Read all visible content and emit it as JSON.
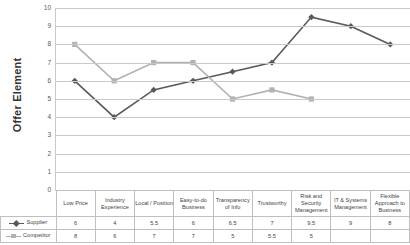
{
  "chart_data": {
    "type": "line",
    "title": "",
    "xlabel": "",
    "ylabel": "Offer Element",
    "ylim": [
      0,
      10
    ],
    "ytick_step": 1,
    "yticks": [
      0,
      1,
      2,
      3,
      4,
      5,
      6,
      7,
      8,
      9,
      10
    ],
    "grid": true,
    "legend_position": "data-table-left",
    "categories": [
      "Low Price",
      "Industry Experience",
      "Local / Position",
      "Easy-to-do Business",
      "Transparency of Info",
      "Trustworthy",
      "Risk and Security Management",
      "IT & Systems Management",
      "Flexible Approach to Business"
    ],
    "series": [
      {
        "name": "Supplier",
        "color": "#595959",
        "marker": "diamond",
        "values": [
          6,
          4,
          5.5,
          6,
          6.5,
          7,
          9.5,
          9,
          8
        ],
        "labels": [
          "6",
          "4",
          "5.5",
          "6",
          "6.5",
          "7",
          "9.5",
          "9",
          "8"
        ]
      },
      {
        "name": "Competitor",
        "color": "#b2b2b2",
        "marker": "square",
        "values": [
          8,
          6,
          7,
          7,
          5,
          5.5,
          5,
          null,
          null
        ],
        "labels": [
          "8",
          "6",
          "7",
          "7",
          "5",
          "5.5",
          "5",
          "",
          ""
        ]
      }
    ]
  },
  "table": {
    "row_header_blank": "",
    "columns": [
      "Low Price",
      "Industry Experience",
      "Local / Position",
      "Easy-to-do Business",
      "Transparency of Info",
      "Trustworthy",
      "Risk and Security Management",
      "IT & Systems Management",
      "Flexible Approach to Business"
    ],
    "rows": [
      {
        "label": "Supplier",
        "values": [
          "6",
          "4",
          "5.5",
          "6",
          "6.5",
          "7",
          "9.5",
          "9",
          "8"
        ]
      },
      {
        "label": "Competitor",
        "values": [
          "8",
          "6",
          "7",
          "7",
          "5",
          "5.5",
          "5",
          "",
          ""
        ]
      }
    ]
  }
}
